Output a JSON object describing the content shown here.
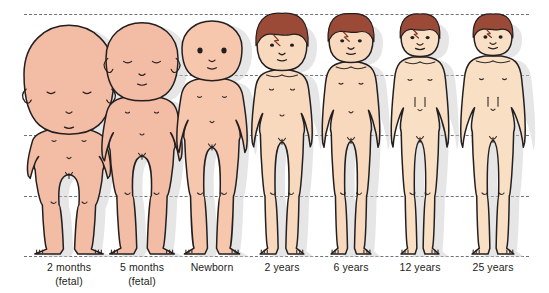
{
  "diagram": {
    "background_color": "#ffffff",
    "reference_lines": [
      {
        "name": "crown-line",
        "y": 14,
        "describes": "top of head / crown"
      },
      {
        "name": "chin-line",
        "y": 75,
        "describes": "chin / base of head"
      },
      {
        "name": "pubis-line",
        "y": 135,
        "describes": "pubic symphysis / mid-body"
      },
      {
        "name": "knee-line",
        "y": 196,
        "describes": "knee level"
      },
      {
        "name": "ground-line",
        "y": 256,
        "describes": "soles of feet / ground"
      }
    ],
    "line_color": "#6f7278",
    "outline_color": "#231f20",
    "shadow_color": "#c9c9c9",
    "caption_color": "#1d1d1b",
    "skin_tones": {
      "fetal": "#F3BCA4",
      "infant": "#F6C7AC",
      "child": "#F8D9BD",
      "adult": "#F9DFC3"
    },
    "hair_color": "#9C4A38",
    "hair_shadow": "#7E3528"
  },
  "figures": [
    {
      "id": "fetal-2-months",
      "caption_line1": "2 months",
      "caption_line2": "(fetal)",
      "x": 14,
      "width": 110,
      "skin": "#F3BCA4",
      "has_hair": false,
      "head_fraction_of_height": 0.5,
      "notes": "very large head, head spans crown line to pubis line"
    },
    {
      "id": "fetal-5-months",
      "caption_line1": "5 months",
      "caption_line2": "(fetal)",
      "x": 96,
      "width": 92,
      "skin": "#F3BCA4",
      "has_hair": false,
      "head_fraction_of_height": 0.33,
      "notes": "large head, short limbs"
    },
    {
      "id": "newborn",
      "caption_line1": "Newborn",
      "caption_line2": "",
      "x": 170,
      "width": 84,
      "skin": "#F6C7AC",
      "has_hair": false,
      "head_fraction_of_height": 0.25,
      "notes": "head about one quarter of body height"
    },
    {
      "id": "child-2-years",
      "caption_line1": "2 years",
      "caption_line2": "",
      "x": 244,
      "width": 76,
      "skin": "#F8D9BD",
      "has_hair": true,
      "head_fraction_of_height": 0.2,
      "notes": "reddish brown hair appears"
    },
    {
      "id": "child-6-years",
      "caption_line1": "6 years",
      "caption_line2": "",
      "x": 315,
      "width": 72,
      "skin": "#F8D9BD",
      "has_hair": true,
      "head_fraction_of_height": 0.167
    },
    {
      "id": "adolescent-12-years",
      "caption_line1": "12 years",
      "caption_line2": "",
      "x": 385,
      "width": 70,
      "skin": "#F9DFC3",
      "has_hair": true,
      "head_fraction_of_height": 0.143
    },
    {
      "id": "adult-25-years",
      "caption_line1": "25 years",
      "caption_line2": "",
      "x": 455,
      "width": 76,
      "skin": "#F9DFC3",
      "has_hair": true,
      "head_fraction_of_height": 0.125
    }
  ]
}
